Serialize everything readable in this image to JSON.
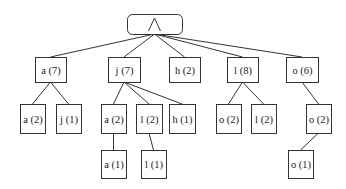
{
  "diagram": {
    "type": "tree",
    "root": {
      "id": "root",
      "label": "",
      "icon": "wedge-icon",
      "x": 127,
      "y": 14,
      "w": 55,
      "h": 20
    },
    "nodes": [
      {
        "id": "n1",
        "label": "a (7)",
        "parent": "root",
        "x": 35,
        "y": 57,
        "w": 31,
        "h": 25
      },
      {
        "id": "n2",
        "label": "j (7)",
        "parent": "root",
        "x": 108,
        "y": 57,
        "w": 32,
        "h": 25
      },
      {
        "id": "n3",
        "label": "h (2)",
        "parent": "root",
        "x": 169,
        "y": 57,
        "w": 31,
        "h": 25
      },
      {
        "id": "n4",
        "label": "l (8)",
        "parent": "root",
        "x": 227,
        "y": 57,
        "w": 31,
        "h": 25
      },
      {
        "id": "n5",
        "label": "o (6)",
        "parent": "root",
        "x": 286,
        "y": 57,
        "w": 32,
        "h": 25
      },
      {
        "id": "n6",
        "label": "a (2)",
        "parent": "n1",
        "x": 20,
        "y": 104,
        "w": 25,
        "h": 29
      },
      {
        "id": "n7",
        "label": "j (1)",
        "parent": "n1",
        "x": 56,
        "y": 104,
        "w": 25,
        "h": 29
      },
      {
        "id": "n8",
        "label": "a (2)",
        "parent": "n2",
        "x": 101,
        "y": 104,
        "w": 25,
        "h": 29
      },
      {
        "id": "n9",
        "label": "l (2)",
        "parent": "n2",
        "x": 136,
        "y": 104,
        "w": 26,
        "h": 29
      },
      {
        "id": "n10",
        "label": "h (1)",
        "parent": "n2",
        "x": 169,
        "y": 104,
        "w": 26,
        "h": 29
      },
      {
        "id": "n11",
        "label": "o (2)",
        "parent": "n4",
        "x": 216,
        "y": 104,
        "w": 25,
        "h": 29
      },
      {
        "id": "n12",
        "label": "l (2)",
        "parent": "n4",
        "x": 251,
        "y": 104,
        "w": 25,
        "h": 29
      },
      {
        "id": "n13",
        "label": "o (2)",
        "parent": "n5",
        "x": 306,
        "y": 104,
        "w": 25,
        "h": 29
      },
      {
        "id": "n14",
        "label": "a (1)",
        "parent": "n8",
        "x": 101,
        "y": 150,
        "w": 25,
        "h": 28
      },
      {
        "id": "n15",
        "label": "l (1)",
        "parent": "n9",
        "x": 141,
        "y": 150,
        "w": 25,
        "h": 28
      },
      {
        "id": "n16",
        "label": "o (1)",
        "parent": "n13",
        "x": 288,
        "y": 150,
        "w": 25,
        "h": 28
      }
    ]
  }
}
